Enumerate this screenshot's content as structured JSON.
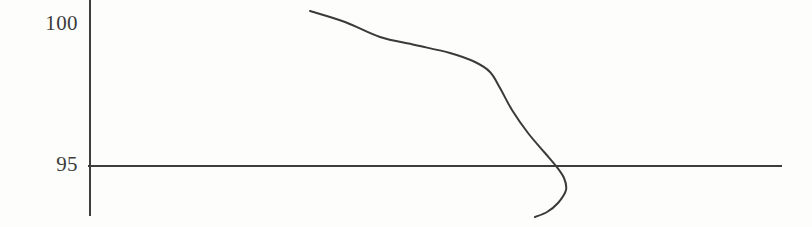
{
  "figure": {
    "background_color": "#fdfdfc",
    "line_color": "#3a3a3a",
    "axis_color": "#3d3d3d",
    "label_color": "#3b3b3b"
  },
  "axis": {
    "y_ticks": [
      {
        "label": "100",
        "value": 100,
        "pixel_y": 25
      },
      {
        "label": "95",
        "value": 95,
        "pixel_y": 166
      }
    ],
    "y_axis_pixel_x": 90,
    "y_axis_top_pixel_y": 0,
    "y_axis_bottom_pixel_y": 216,
    "reference_line_pixel_y": 166,
    "reference_line_start_pixel_x": 88,
    "reference_line_end_pixel_x": 782
  },
  "chart_data": {
    "type": "line",
    "title": "",
    "xlabel": "",
    "ylabel": "",
    "xlim": [
      0,
      1
    ],
    "ylim": [
      93.2,
      100.5
    ],
    "grid": false,
    "legend": null,
    "y_tick_values": [
      95,
      100
    ],
    "y_tick_labels": [
      "95",
      "100"
    ],
    "x_axis_visible": false,
    "reference_lines": [
      {
        "orientation": "horizontal",
        "y": 95
      }
    ],
    "series": [
      {
        "name": "curve",
        "x": [
          0.318,
          0.375,
          0.432,
          0.489,
          0.545,
          0.583,
          0.6,
          0.616,
          0.64,
          0.662,
          0.678,
          0.686,
          0.684,
          0.672,
          0.65,
          0.628,
          0.607
        ],
        "y": [
          100.46,
          100.0,
          99.5,
          99.0,
          98.52,
          98.22,
          98.0,
          97.6,
          96.8,
          95.9,
          95.2,
          94.7,
          94.3,
          93.95,
          93.72,
          93.58,
          93.5
        ],
        "pixel_points": [
          [
            310,
            11
          ],
          [
            345,
            22
          ],
          [
            380,
            37
          ],
          [
            415,
            45
          ],
          [
            450,
            53
          ],
          [
            475,
            62
          ],
          [
            490,
            72
          ],
          [
            500,
            88
          ],
          [
            512,
            110
          ],
          [
            528,
            133
          ],
          [
            545,
            153
          ],
          [
            556,
            166
          ],
          [
            564,
            178
          ],
          [
            566,
            190
          ],
          [
            558,
            203
          ],
          [
            547,
            212
          ],
          [
            535,
            217
          ]
        ]
      }
    ]
  }
}
